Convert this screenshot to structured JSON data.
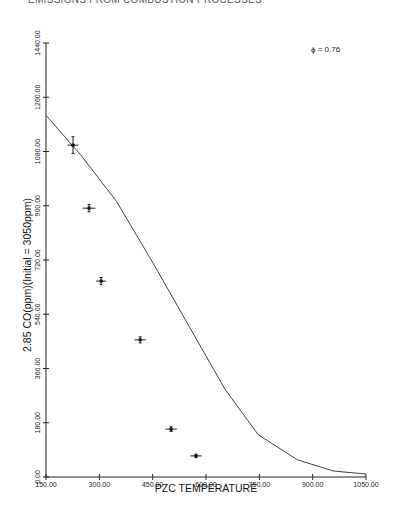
{
  "header": {
    "text": "EMISSIONS FROM COMBUSTION PROCESSES"
  },
  "chart_data": {
    "type": "scatter",
    "title": "",
    "xlabel": "PZC TEMPERATURE",
    "ylabel": "2.85 CO(ppm)(Initial = 3050ppm)",
    "annotation": "ϕ = 0.76",
    "xlim": [
      150,
      1050
    ],
    "ylim": [
      0,
      1440
    ],
    "x_ticks": [
      150,
      300,
      450,
      600,
      750,
      900,
      1050
    ],
    "x_tick_labels": [
      "150.00",
      "300.00",
      "450.00",
      "600.00",
      "750.00",
      "900.00",
      "1050.00"
    ],
    "y_ticks": [
      0,
      180,
      360,
      540,
      720,
      900,
      1080,
      1260,
      1440
    ],
    "y_tick_labels": [
      "0.00",
      "180.00",
      "360.00",
      "540.00",
      "720.00",
      "900.00",
      "1080.00",
      "1260.00",
      "1440.00"
    ],
    "grid": false,
    "series": [
      {
        "name": "measured",
        "type": "scatter",
        "marker": "error-cross",
        "x": [
          226,
          271,
          305,
          415,
          502,
          572
        ],
        "y": [
          1101,
          892,
          650,
          455,
          159,
          70
        ],
        "xerr": [
          15,
          18,
          14,
          16,
          16,
          16
        ],
        "yerr": [
          28,
          12,
          12,
          10,
          8,
          6
        ]
      },
      {
        "name": "model",
        "type": "line",
        "x": [
          150,
          246,
          348,
          451,
          654,
          747,
          857,
          958,
          1050
        ],
        "y": [
          1200,
          1071,
          915,
          710,
          290,
          140,
          57,
          20,
          10
        ]
      }
    ]
  }
}
